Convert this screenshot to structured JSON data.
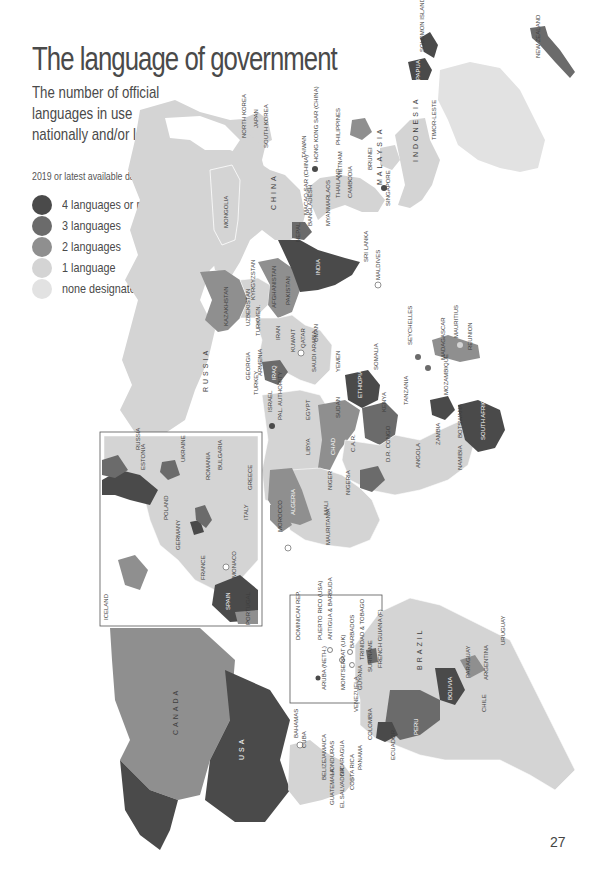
{
  "page": {
    "title": "The language of government",
    "subtitle": "The number of official languages in use nationally and/or locally",
    "note": "2019 or latest available data",
    "page_number": "27"
  },
  "legend": {
    "items": [
      {
        "label": "4 languages or more",
        "color": "#4a4a4a"
      },
      {
        "label": "3 languages",
        "color": "#6b6b6b"
      },
      {
        "label": "2 languages",
        "color": "#8f8f8f"
      },
      {
        "label": "1 language",
        "color": "#d4d4d4"
      },
      {
        "label": "none designated",
        "color": "#e2e2e2"
      }
    ]
  },
  "map": {
    "orientation": "rotated 90° clockwise",
    "colors": {
      "four_plus": "#4a4a4a",
      "three": "#6b6b6b",
      "two": "#8f8f8f",
      "one": "#d4d4d4",
      "none": "#e2e2e2",
      "water": "#ffffff"
    },
    "labels": {
      "russia": "RUSSIA",
      "china": "CHINA",
      "mongolia": "MONGOLIA",
      "kazakhstan": "KAZAKHSTAN",
      "kyrgyzstan": "KYRGYZSTAN",
      "tajikistan": "TAJIKISTAN",
      "uzbekistan": "UZBEKISTAN",
      "turkmen": "TURKMEN.",
      "afghanistan": "AFGHANISTAN",
      "pakistan": "PAKISTAN",
      "india": "INDIA",
      "nepal": "NEPAL",
      "bhutan": "BHUTAN",
      "bangladesh": "BANGLADESH",
      "myanmar": "MYANMAR",
      "sri_lanka": "SRI LANKA",
      "maldives": "MALDIVES",
      "iran": "IRAN",
      "iraq": "IRAQ",
      "syria": "SYRIA",
      "kuwait": "KUWAIT",
      "bahrain": "BAHRAIN",
      "qatar": "QATAR",
      "uae": "U.A.E.",
      "oman": "OMAN",
      "saudi_arabia": "SAUDI ARABIA",
      "yemen": "YEMEN",
      "jordan": "JORDAN",
      "israel": "ISRAEL",
      "pal_authority": "PAL. AUTHORITY",
      "lebanon": "LEB.",
      "cyprus": "CYPRUS",
      "turkey": "TURKEY",
      "georgia": "GEORGIA",
      "armenia": "ARMENIA",
      "azerbaijan": "AZER.",
      "japan": "JAPAN",
      "north_korea": "NORTH KOREA",
      "south_korea": "SOUTH KOREA",
      "taiwan": "TAIWAN",
      "hong_kong": "HONG KONG SAR (CHINA)",
      "macao": "MACAO SAR (CHINA)",
      "laos": "LAOS",
      "thailand": "THAILAND",
      "vietnam": "VIETNAM",
      "cambodia": "CAMBODIA",
      "philippines": "PHILIPPINES",
      "brunei": "BRUNEI",
      "malaysia": "MALAYSIA",
      "singapore": "SINGAPORE",
      "indonesia": "INDONESIA",
      "timor_leste": "TIMOR-LESTE",
      "png": "PAPUA NEW GUINEA",
      "solomon": "SOLOMON ISLANDS",
      "new_zealand": "NEW ZEALAND",
      "egypt": "EGYPT",
      "sudan": "SUDAN",
      "south_sudan": "S. SUDAN",
      "eritrea": "ERITREA",
      "ethiopia": "ETHIOPIA",
      "djibouti": "DJIBOUTI",
      "somalia": "SOMALIA",
      "kenya": "KENYA",
      "uganda": "UGANDA",
      "tanzania": "TANZANIA",
      "rwanda": "RWANDA",
      "burundi": "BURUNDI",
      "dr_congo": "D.R. CONGO",
      "car": "C.A.R.",
      "chad": "CHAD",
      "libya": "LIBYA",
      "tunisia": "TUNISIA",
      "malta": "MALTA",
      "algeria": "ALGERIA",
      "morocco": "MOROCCO",
      "western_sahara": "WESTERN SAHARA (MAR.)",
      "mauritania": "MAURITANIA",
      "mali": "MALI",
      "niger": "NIGER",
      "nigeria": "NIGERIA",
      "cameroon": "CAMEROON",
      "gabon": "GABON",
      "congo": "CONGO",
      "eq_guinea": "EQUATORIAL GUINEA",
      "burkina": "BURKINA FASO",
      "ghana": "GHANA",
      "togo": "TOGO",
      "benin": "BENIN",
      "cote": "COTE D'IVOIRE",
      "liberia": "LIBERIA",
      "sierra_leone": "SIERRA LEONE",
      "guinea": "GUINEA",
      "guinea_bissau": "GUINEA-BISSAU",
      "gambia": "GAMBIA",
      "senegal": "SENEGAL",
      "cape_verde": "CAPE VERDE",
      "angola": "ANGOLA",
      "zambia": "ZAMBIA",
      "malawi": "MALAWI",
      "zimbabwe": "ZIMBABWE",
      "mozambique": "MOZAMBIQUE",
      "namibia": "NAMIBIA",
      "botswana": "BOTSWANA",
      "south_africa": "SOUTH AFRICA",
      "swaziland": "SWAZILAND",
      "lesotho": "LESOTHO",
      "madagascar": "MADAGASCAR",
      "comoros": "COMOROS",
      "seychelles": "SEYCHELLES",
      "mauritius": "MAURITIUS",
      "reunion": "REUNION",
      "iceland": "ICELAND",
      "ireland": "IRELAND",
      "uk": "UK",
      "norway": "NORWAY",
      "sweden": "SWEDEN",
      "finland": "FINLAND",
      "denmark": "DENMARK",
      "estonia": "ESTONIA",
      "latvia": "LATVIA",
      "lithuania": "LITHUANIA",
      "belarus": "BELARUS",
      "poland": "POLAND",
      "germany": "GERMANY",
      "netherlands": "NETH.",
      "belgium": "BELGIUM",
      "lux": "LUX.",
      "france": "FRANCE",
      "monaco": "MONACO",
      "andorra": "ANDORRA",
      "spain": "SPAIN",
      "portugal": "PORTUGAL",
      "switzerland": "SWITZ.",
      "austria": "AUSTRIA",
      "czech": "CZECH REP.",
      "slovakia": "SLOVAKIA",
      "hungary": "HUNGARY",
      "slovenia": "SLOVENIA",
      "croatia": "CROATIA",
      "bosnia": "BOSNIA",
      "serbia": "SERBIA",
      "montenegro": "MONT.",
      "albania": "ALBANIA",
      "mac_rep": "MAC. REP. OF",
      "romania": "ROMANIA",
      "moldova": "MOLDOVA",
      "ukraine": "UKRAINE",
      "bulgaria": "BULGARIA",
      "greece": "GREECE",
      "italy": "ITALY",
      "russia_inset": "RUSSIA",
      "canada": "CANADA",
      "usa": "USA",
      "bahamas": "BAHAMAS",
      "cuba": "CUBA",
      "jamaica": "JAMAICA",
      "belize": "BELIZE",
      "honduras": "HONDURAS",
      "nicaragua": "NICARAGUA",
      "guatemala": "GUATEMALA",
      "el_salvador": "EL SALVADOR",
      "costa_rica": "COSTA RICA",
      "panama": "PANAMA",
      "dominican": "DOMINICAN REP.",
      "haiti": "HAITI",
      "puerto_rico": "PUERTO RICO (USA)",
      "antigua": "ANTIGUA & BARBUDA",
      "montserrat": "MONTSERRAT (UK)",
      "barbados": "BARBADOS",
      "grenada": "GRENADA",
      "trinidad": "TRINIDAD & TOBAGO",
      "aruba": "ARUBA (NETH.)",
      "venezuela": "VENEZUELA",
      "guyana": "GUYANA",
      "suriname": "SURINAME",
      "french_guiana": "FRENCH GUIANA (F)",
      "colombia": "COLOMBIA",
      "ecuador": "ECUADOR",
      "peru": "PERU",
      "brazil": "BRAZIL",
      "bolivia": "BOLIVIA",
      "paraguay": "PARAGUAY",
      "chile": "CHILE",
      "argentina": "ARGENTINA",
      "uruguay": "URUGUAY"
    }
  }
}
